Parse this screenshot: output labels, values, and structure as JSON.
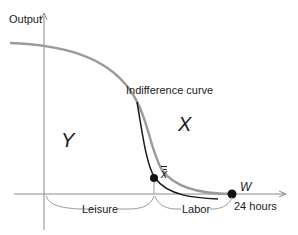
{
  "diagram": {
    "axes": {
      "y_label": "Output",
      "x_end_label": "24 hours"
    },
    "curves": {
      "indifference_label": "Indifference curve",
      "ppf_color": "#999999",
      "indifference_color": "#1a1a1a"
    },
    "regions": {
      "left": "Y",
      "right": "X"
    },
    "points": {
      "optimum": "x̄",
      "endpoint": "W"
    },
    "braces": {
      "leisure": "Leisure",
      "labor": "Labor"
    }
  }
}
